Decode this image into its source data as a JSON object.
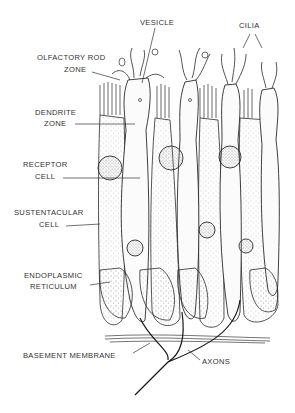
{
  "diagram": {
    "labels": {
      "vesicle": "VESICLE",
      "cilia": "CILIA",
      "olfactory_rod_zone_1": "OLFACTORY ROD",
      "olfactory_rod_zone_2": "ZONE",
      "dendrite_zone_1": "DENDRITE",
      "dendrite_zone_2": "ZONE",
      "receptor_cell_1": "RECEPTOR",
      "receptor_cell_2": "CELL",
      "sustentacular_cell_1": "SUSTENTACULAR",
      "sustentacular_cell_2": "CELL",
      "endoplasmic_reticulum_1": "ENDOPLASMIC",
      "endoplasmic_reticulum_2": "RETICULUM",
      "basement_membrane": "BASEMENT  MEMBRANE",
      "axons": "AXONS"
    },
    "colors": {
      "ink": "#2a2a2a",
      "label": "#333333",
      "background": "#ffffff",
      "stipple": "#9a9a9a"
    }
  }
}
